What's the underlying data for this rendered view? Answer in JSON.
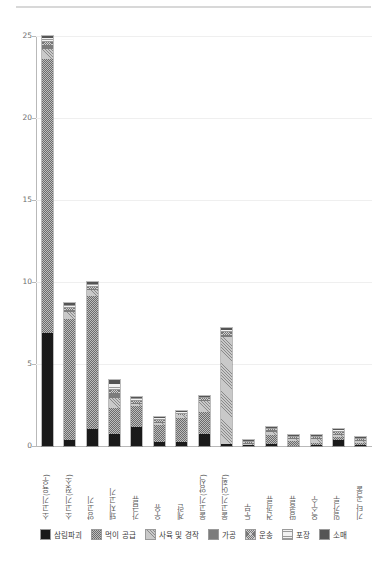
{
  "chart_data": {
    "type": "bar",
    "subtype": "stacked-bar",
    "title": "",
    "xlabel": "",
    "ylabel": "",
    "ylim": [
      0,
      25
    ],
    "yticks": [
      0,
      5,
      10,
      15,
      20,
      25
    ],
    "ytick_labels": [
      "0",
      "5",
      "10",
      "15",
      "20",
      "25"
    ],
    "grid": true,
    "grid_axis": "y",
    "legend_position": "bottom",
    "categories": [
      "소고기(육우)",
      "소고기(젖소)",
      "양고기",
      "돼지고기",
      "가금류",
      "우유",
      "계란",
      "물고기(양식)",
      "물고기(어획)",
      "두부",
      "견과류",
      "땅콩류",
      "옥수수",
      "밀가루",
      "기타 곡물"
    ],
    "series": [
      {
        "name": "삼림파괴",
        "color": "#1a1a1a",
        "pattern": "solid-dark",
        "values": [
          6.9,
          0.35,
          1.05,
          0.75,
          1.15,
          0.25,
          0.25,
          0.75,
          0.15,
          0.05,
          0.15,
          0.0,
          0.05,
          0.35,
          0.05
        ]
      },
      {
        "name": "먹이 공급",
        "color": "#bdbdbd",
        "pattern": "dotted",
        "values": [
          16.7,
          7.4,
          8.1,
          1.55,
          1.3,
          1.05,
          1.45,
          1.35,
          0.0,
          0.0,
          0.55,
          0.3,
          0.1,
          0.2,
          0.1
        ]
      },
      {
        "name": "사육 및 경작",
        "color": "#c9c9c9",
        "pattern": "diagonal-hatch",
        "values": [
          0.6,
          0.45,
          0.35,
          0.6,
          0.1,
          0.1,
          0.2,
          0.65,
          6.5,
          0.05,
          0.15,
          0.15,
          0.25,
          0.1,
          0.15
        ]
      },
      {
        "name": "가공",
        "color": "#7c7c7c",
        "pattern": "solid-mid",
        "values": [
          0.25,
          0.1,
          0.1,
          0.35,
          0.1,
          0.05,
          0.0,
          0.05,
          0.15,
          0.05,
          0.1,
          0.05,
          0.05,
          0.1,
          0.05
        ]
      },
      {
        "name": "운송",
        "color": "#cfcfcf",
        "pattern": "cross-hatch",
        "values": [
          0.2,
          0.1,
          0.1,
          0.15,
          0.1,
          0.1,
          0.05,
          0.1,
          0.15,
          0.05,
          0.05,
          0.05,
          0.05,
          0.1,
          0.05
        ]
      },
      {
        "name": "포장",
        "color": "#f2f2f2",
        "pattern": "horizontal-lines",
        "values": [
          0.25,
          0.2,
          0.2,
          0.4,
          0.2,
          0.15,
          0.1,
          0.1,
          0.15,
          0.05,
          0.05,
          0.05,
          0.05,
          0.15,
          0.05
        ]
      },
      {
        "name": "소매",
        "color": "#555555",
        "pattern": "solid-darkmid",
        "values": [
          0.1,
          0.1,
          0.1,
          0.2,
          0.05,
          0.05,
          0.05,
          0.05,
          0.1,
          0.05,
          0.05,
          0.05,
          0.05,
          0.05,
          0.05
        ]
      }
    ],
    "totals": [
      25.0,
      8.7,
      10.0,
      4.0,
      3.0,
      1.75,
      2.1,
      3.05,
      7.2,
      0.3,
      1.1,
      0.65,
      0.6,
      1.05,
      0.5
    ]
  },
  "legend": {
    "items": [
      {
        "label": "삼림파괴",
        "key": "deforest"
      },
      {
        "label": "먹이 공급",
        "key": "feed"
      },
      {
        "label": "사육 및 경작",
        "key": "farm"
      },
      {
        "label": "가공",
        "key": "process"
      },
      {
        "label": "운송",
        "key": "transport"
      },
      {
        "label": "포장",
        "key": "package"
      },
      {
        "label": "소매",
        "key": "retail"
      }
    ]
  }
}
